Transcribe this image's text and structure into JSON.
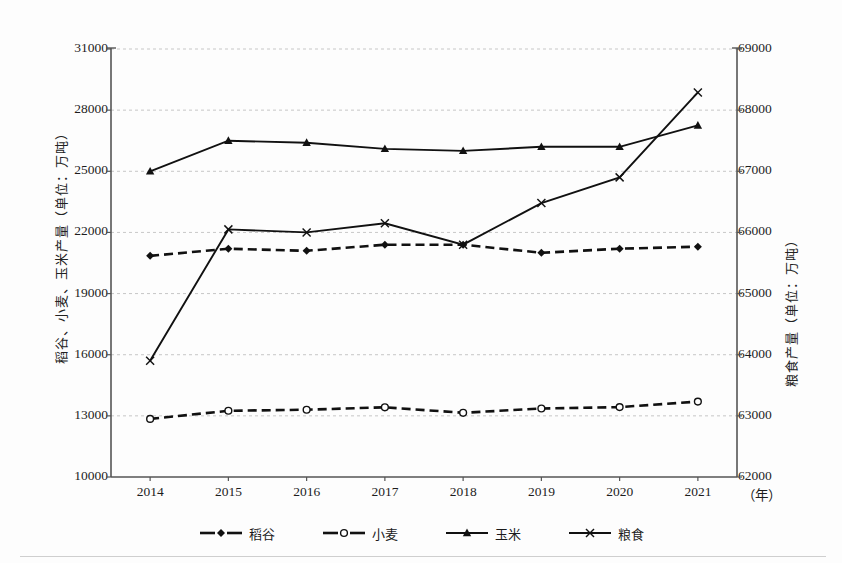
{
  "chart_data": {
    "type": "line",
    "title": "",
    "xlabel": "（年）",
    "x": [
      "2014",
      "2015",
      "2016",
      "2017",
      "2018",
      "2019",
      "2020",
      "2021"
    ],
    "categories": [
      "2014",
      "2015",
      "2016",
      "2017",
      "2018",
      "2019",
      "2020",
      "2021"
    ],
    "grid": true,
    "legend_position": "bottom",
    "axes": {
      "left": {
        "label": "稻谷、小麦、玉米产量（单位：万吨）",
        "ylim": [
          10000,
          31000
        ],
        "tick_step": 3000,
        "ticks": [
          "31000",
          "28000",
          "25000",
          "22000",
          "19000",
          "16000",
          "13000",
          "10000"
        ],
        "tick_values": [
          31000,
          28000,
          25000,
          22000,
          19000,
          16000,
          13000,
          10000
        ]
      },
      "right": {
        "label": "粮食产量（单位：万吨）",
        "ylim": [
          62000,
          69000
        ],
        "tick_step": 1000,
        "ticks": [
          "69000",
          "68000",
          "67000",
          "66000",
          "65000",
          "64000",
          "63000",
          "62000"
        ],
        "tick_values": [
          69000,
          68000,
          67000,
          66000,
          65000,
          64000,
          63000,
          62000
        ]
      }
    },
    "series": [
      {
        "name": "稻谷",
        "axis": "left",
        "line_style": "dashed",
        "marker": "diamond-filled",
        "color": "#111111",
        "values": [
          20850,
          21200,
          21100,
          21400,
          21400,
          21000,
          21200,
          21300
        ]
      },
      {
        "name": "小麦",
        "axis": "left",
        "line_style": "dashed",
        "marker": "circle-open",
        "color": "#111111",
        "values": [
          12850,
          13250,
          13300,
          13420,
          13150,
          13360,
          13430,
          13700
        ]
      },
      {
        "name": "玉米",
        "axis": "left",
        "line_style": "solid",
        "marker": "triangle-filled",
        "color": "#111111",
        "values": [
          25000,
          26500,
          26400,
          26100,
          26000,
          26200,
          26200,
          27250
        ]
      },
      {
        "name": "粮食",
        "axis": "right",
        "line_style": "solid",
        "marker": "cross",
        "color": "#111111",
        "values": [
          63900,
          66050,
          66000,
          66150,
          65800,
          66480,
          66900,
          68290
        ]
      }
    ]
  },
  "legend": {
    "items": [
      {
        "label": "稻谷",
        "marker": "diamond-filled",
        "line_style": "dashed"
      },
      {
        "label": "小麦",
        "marker": "circle-open",
        "line_style": "dashed"
      },
      {
        "label": "玉米",
        "marker": "triangle-filled",
        "line_style": "solid"
      },
      {
        "label": "粮食",
        "marker": "cross",
        "line_style": "solid"
      }
    ]
  }
}
